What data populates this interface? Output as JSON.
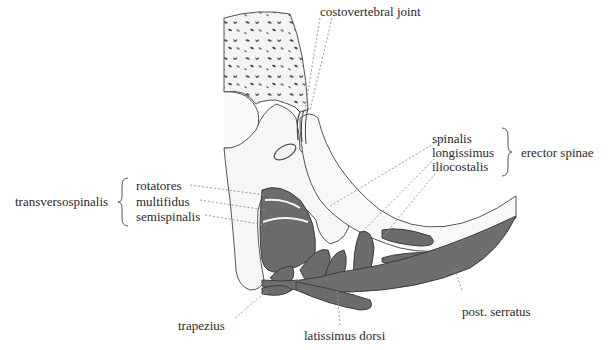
{
  "figure": {
    "colors": {
      "bone_fill": "#f7f7f7",
      "bone_stroke": "#555555",
      "muscle_fill": "#6e6e6e",
      "muscle_dark": "#4a4a4a",
      "leader": "#9a9a9a",
      "text": "#2a2a2a"
    }
  },
  "labels": {
    "costovertebral_joint": "costovertebral joint",
    "spinalis": "spinalis",
    "longissimus": "longissimus",
    "iliocostalis": "iliocostalis",
    "erector_spinae": "erector spinae",
    "transversospinalis": "transversospinalis",
    "rotatores": "rotatores",
    "multifidus": "multifidus",
    "semispinalis": "semispinalis",
    "trapezius": "trapezius",
    "latissimus_dorsi": "latissimus dorsi",
    "post_serratus": "post. serratus"
  },
  "groups": [
    {
      "name": "erector spinae",
      "members": [
        "spinalis",
        "longissimus",
        "iliocostalis"
      ]
    },
    {
      "name": "transversospinalis",
      "members": [
        "rotatores",
        "multifidus",
        "semispinalis"
      ]
    }
  ]
}
